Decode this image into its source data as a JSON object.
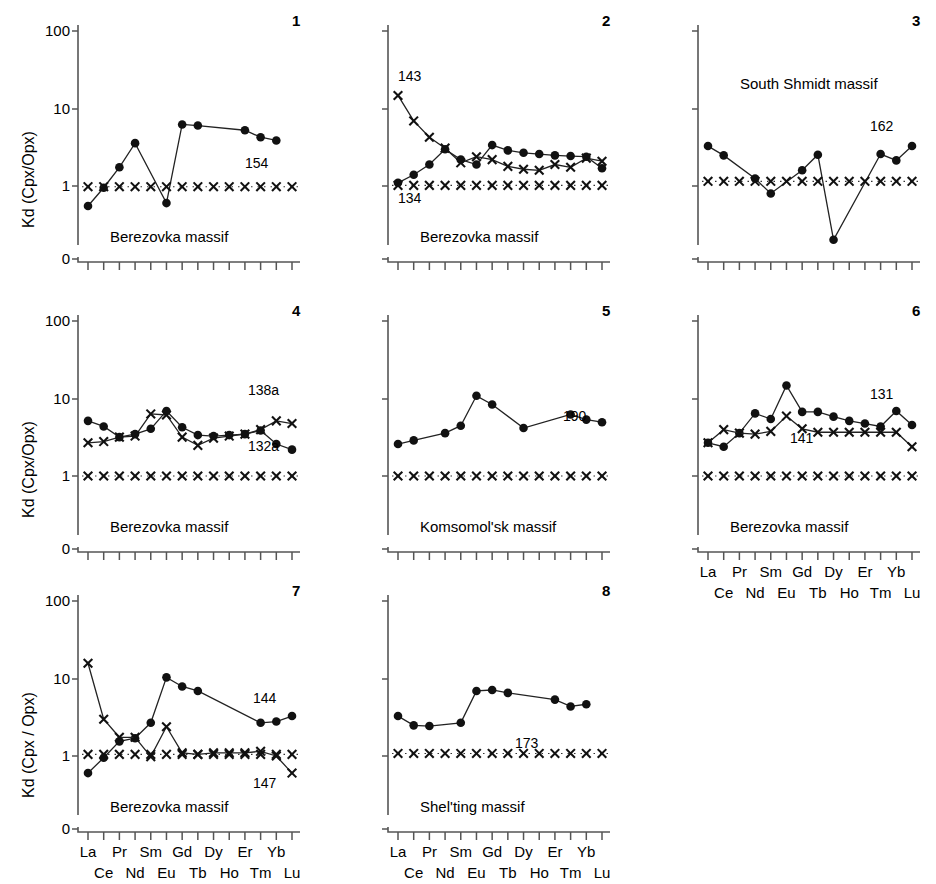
{
  "figure": {
    "background": "#ffffff",
    "marker_color": "#111111",
    "line_color": "#222222"
  },
  "axes": {
    "ylabel_default": "Kd (Cpx/Opx)",
    "ylabel_panel7": "Kd (Cpx / Opx)",
    "yticks": [
      "100",
      "10",
      "1",
      "0"
    ],
    "xlabels_top": [
      "La",
      "Pr",
      "Sm",
      "Gd",
      "Dy",
      "Er",
      "Yb"
    ],
    "xlabels_bottom": [
      "Ce",
      "Nd",
      "Eu",
      "Tb",
      "Ho",
      "Tm",
      "Lu"
    ]
  },
  "panels": [
    {
      "number": "1",
      "massif": "Berezovka massif",
      "series_labels": [
        "154"
      ],
      "has_ylabel": true
    },
    {
      "number": "2",
      "massif": "Berezovka massif",
      "series_labels": [
        "143",
        "134"
      ],
      "has_ylabel": false
    },
    {
      "number": "3",
      "massif": "South Shmidt massif",
      "series_labels": [
        "162"
      ],
      "has_ylabel": false
    },
    {
      "number": "4",
      "massif": "Berezovka massif",
      "series_labels": [
        "138a",
        "132a"
      ],
      "has_ylabel": true
    },
    {
      "number": "5",
      "massif": "Komsomol'sk massif",
      "series_labels": [
        "190"
      ],
      "has_ylabel": false
    },
    {
      "number": "6",
      "massif": "Berezovka massif",
      "series_labels": [
        "131",
        "141"
      ],
      "has_ylabel": false
    },
    {
      "number": "7",
      "massif": "Berezovka massif",
      "series_labels": [
        "144",
        "147"
      ],
      "has_ylabel": true
    },
    {
      "number": "8",
      "massif": "Shel'ting massif",
      "series_labels": [
        "173"
      ],
      "has_ylabel": false
    }
  ],
  "chart_data": [
    {
      "type": "line",
      "panel": "1",
      "title": "Berezovka massif",
      "xlabel": "",
      "ylabel": "Kd (Cpx/Opx)",
      "yscale": "log",
      "ylim": [
        0.1,
        100
      ],
      "ytick_values": [
        1,
        10,
        100
      ],
      "grid": false,
      "legend": "none",
      "categories": [
        "La",
        "Ce",
        "Pr",
        "Nd",
        "Sm",
        "Eu",
        "Gd",
        "Tb",
        "Dy",
        "Ho",
        "Er",
        "Tm",
        "Yb",
        "Lu"
      ],
      "series": [
        {
          "name": "154",
          "marker": "circle",
          "values": [
            0.55,
            0.95,
            1.75,
            3.6,
            null,
            0.6,
            6.3,
            6.1,
            null,
            null,
            5.3,
            4.3,
            3.9,
            null
          ]
        },
        {
          "name": "reference",
          "marker": "cross",
          "values": [
            0.98,
            0.98,
            0.98,
            0.98,
            0.98,
            0.98,
            0.98,
            0.98,
            0.98,
            0.98,
            0.98,
            0.98,
            0.98,
            0.98
          ]
        }
      ]
    },
    {
      "type": "line",
      "panel": "2",
      "title": "Berezovka massif",
      "xlabel": "",
      "ylabel": "",
      "yscale": "log",
      "ylim": [
        0.1,
        100
      ],
      "ytick_values": [
        1,
        10,
        100
      ],
      "grid": false,
      "legend": "none",
      "categories": [
        "La",
        "Ce",
        "Pr",
        "Nd",
        "Sm",
        "Eu",
        "Gd",
        "Tb",
        "Dy",
        "Ho",
        "Er",
        "Tm",
        "Yb",
        "Lu"
      ],
      "series": [
        {
          "name": "143",
          "marker": "cross",
          "values": [
            15.0,
            7.0,
            4.3,
            3.1,
            2.0,
            2.4,
            2.2,
            1.8,
            1.65,
            1.6,
            1.9,
            1.75,
            2.3,
            2.1,
            1.6
          ]
        },
        {
          "name": "134",
          "marker": "circle",
          "values": [
            1.1,
            1.4,
            1.9,
            3.0,
            2.2,
            1.9,
            3.4,
            2.9,
            2.7,
            2.6,
            2.5,
            2.45,
            2.4,
            1.7
          ]
        },
        {
          "name": "reference",
          "marker": "cross",
          "values": [
            1.02,
            1.02,
            1.02,
            1.02,
            1.02,
            1.02,
            1.02,
            1.02,
            1.02,
            1.02,
            1.02,
            1.02,
            1.02,
            1.02
          ]
        }
      ]
    },
    {
      "type": "line",
      "panel": "3",
      "title": "South Shmidt massif",
      "xlabel": "",
      "ylabel": "",
      "yscale": "log",
      "ylim": [
        0.1,
        100
      ],
      "ytick_values": [
        1,
        10,
        100
      ],
      "grid": false,
      "legend": "none",
      "categories": [
        "La",
        "Ce",
        "Pr",
        "Nd",
        "Sm",
        "Eu",
        "Gd",
        "Tb",
        "Dy",
        "Ho",
        "Er",
        "Tm",
        "Yb",
        "Lu"
      ],
      "series": [
        {
          "name": "162",
          "marker": "circle",
          "values": [
            3.3,
            2.5,
            null,
            1.25,
            0.8,
            null,
            1.6,
            2.55,
            0.2,
            null,
            null,
            2.6,
            2.15,
            3.3
          ]
        },
        {
          "name": "reference",
          "marker": "cross",
          "values": [
            1.15,
            1.15,
            1.15,
            1.15,
            1.15,
            1.15,
            1.15,
            1.15,
            1.15,
            1.15,
            1.15,
            1.15,
            1.15,
            1.15
          ]
        }
      ]
    },
    {
      "type": "line",
      "panel": "4",
      "title": "Berezovka massif",
      "xlabel": "",
      "ylabel": "Kd (Cpx/Opx)",
      "yscale": "log",
      "ylim": [
        0.1,
        100
      ],
      "ytick_values": [
        1,
        10,
        100
      ],
      "grid": false,
      "legend": "none",
      "categories": [
        "La",
        "Ce",
        "Pr",
        "Nd",
        "Sm",
        "Eu",
        "Gd",
        "Tb",
        "Dy",
        "Ho",
        "Er",
        "Tm",
        "Yb",
        "Lu"
      ],
      "series": [
        {
          "name": "138a",
          "marker": "cross",
          "values": [
            2.7,
            2.8,
            3.2,
            3.3,
            6.4,
            6.2,
            3.2,
            2.5,
            3.1,
            3.3,
            3.5,
            4.0,
            5.2,
            4.8
          ]
        },
        {
          "name": "132a",
          "marker": "circle",
          "values": [
            5.2,
            4.4,
            3.2,
            3.5,
            4.1,
            7.0,
            4.3,
            3.4,
            3.3,
            3.4,
            3.5,
            3.9,
            2.6,
            2.2
          ]
        },
        {
          "name": "reference",
          "marker": "cross",
          "values": [
            1.0,
            1.0,
            1.0,
            1.0,
            1.0,
            1.0,
            1.0,
            1.0,
            1.0,
            1.0,
            1.0,
            1.0,
            1.0,
            1.0
          ]
        }
      ]
    },
    {
      "type": "line",
      "panel": "5",
      "title": "Komsomol'sk massif",
      "xlabel": "",
      "ylabel": "",
      "yscale": "log",
      "ylim": [
        0.1,
        100
      ],
      "ytick_values": [
        1,
        10,
        100
      ],
      "grid": false,
      "legend": "none",
      "categories": [
        "La",
        "Ce",
        "Pr",
        "Nd",
        "Sm",
        "Eu",
        "Gd",
        "Tb",
        "Dy",
        "Ho",
        "Er",
        "Tm",
        "Yb",
        "Lu"
      ],
      "series": [
        {
          "name": "190",
          "marker": "circle",
          "values": [
            2.6,
            2.9,
            null,
            3.6,
            4.5,
            11.0,
            8.5,
            null,
            4.2,
            null,
            null,
            6.3,
            5.4,
            5.0
          ]
        },
        {
          "name": "reference",
          "marker": "cross",
          "values": [
            1.0,
            1.0,
            1.0,
            1.0,
            1.0,
            1.0,
            1.0,
            1.0,
            1.0,
            1.0,
            1.0,
            1.0,
            1.0,
            1.0
          ]
        }
      ]
    },
    {
      "type": "line",
      "panel": "6",
      "title": "Berezovka massif",
      "xlabel": "",
      "ylabel": "",
      "yscale": "log",
      "ylim": [
        0.1,
        100
      ],
      "ytick_values": [
        1,
        10,
        100
      ],
      "grid": false,
      "legend": "none",
      "categories": [
        "La",
        "Ce",
        "Pr",
        "Nd",
        "Sm",
        "Eu",
        "Gd",
        "Tb",
        "Dy",
        "Ho",
        "Er",
        "Tm",
        "Yb",
        "Lu"
      ],
      "series": [
        {
          "name": "131",
          "marker": "circle",
          "values": [
            2.7,
            2.4,
            3.6,
            6.5,
            5.5,
            15.0,
            6.8,
            6.8,
            5.9,
            5.2,
            4.8,
            4.4,
            7.0,
            4.6
          ]
        },
        {
          "name": "141",
          "marker": "cross",
          "values": [
            2.7,
            4.0,
            3.6,
            3.5,
            3.8,
            6.0,
            4.1,
            3.7,
            3.7,
            3.7,
            3.7,
            3.7,
            3.7,
            2.4
          ]
        },
        {
          "name": "reference",
          "marker": "cross",
          "values": [
            1.0,
            1.0,
            1.0,
            1.0,
            1.0,
            1.0,
            1.0,
            1.0,
            1.0,
            1.0,
            1.0,
            1.0,
            1.0,
            1.0
          ]
        }
      ]
    },
    {
      "type": "line",
      "panel": "7",
      "title": "Berezovka massif",
      "xlabel": "",
      "ylabel": "Kd (Cpx / Opx)",
      "yscale": "log",
      "ylim": [
        0.1,
        100
      ],
      "ytick_values": [
        1,
        10,
        100
      ],
      "grid": false,
      "legend": "none",
      "categories": [
        "La",
        "Ce",
        "Pr",
        "Nd",
        "Sm",
        "Eu",
        "Gd",
        "Tb",
        "Dy",
        "Ho",
        "Er",
        "Tm",
        "Yb",
        "Lu"
      ],
      "series": [
        {
          "name": "144",
          "marker": "circle",
          "values": [
            0.6,
            0.95,
            1.55,
            1.7,
            2.7,
            10.5,
            8.0,
            7.0,
            null,
            null,
            null,
            2.7,
            2.8,
            3.3
          ]
        },
        {
          "name": "147",
          "marker": "cross",
          "values": [
            16.0,
            3.0,
            1.75,
            1.75,
            0.98,
            2.4,
            1.1,
            1.05,
            1.1,
            1.1,
            1.1,
            1.15,
            1.0,
            0.6
          ]
        },
        {
          "name": "reference",
          "marker": "cross",
          "values": [
            1.05,
            1.05,
            1.05,
            1.05,
            1.05,
            1.05,
            1.05,
            1.05,
            1.05,
            1.05,
            1.05,
            1.05,
            1.05,
            1.05
          ]
        }
      ]
    },
    {
      "type": "line",
      "panel": "8",
      "title": "Shel'ting massif",
      "xlabel": "",
      "ylabel": "",
      "yscale": "log",
      "ylim": [
        0.1,
        100
      ],
      "ytick_values": [
        1,
        10,
        100
      ],
      "grid": false,
      "legend": "none",
      "categories": [
        "La",
        "Ce",
        "Pr",
        "Nd",
        "Sm",
        "Eu",
        "Gd",
        "Tb",
        "Dy",
        "Ho",
        "Er",
        "Tm",
        "Yb",
        "Lu"
      ],
      "series": [
        {
          "name": "173",
          "marker": "circle",
          "values": [
            3.3,
            2.5,
            2.45,
            null,
            2.7,
            7.0,
            7.2,
            6.6,
            null,
            null,
            5.4,
            4.4,
            4.7,
            null
          ]
        },
        {
          "name": "reference",
          "marker": "cross",
          "values": [
            1.08,
            1.08,
            1.08,
            1.08,
            1.08,
            1.08,
            1.08,
            1.08,
            1.08,
            1.08,
            1.08,
            1.08,
            1.08,
            1.08
          ]
        }
      ]
    }
  ]
}
